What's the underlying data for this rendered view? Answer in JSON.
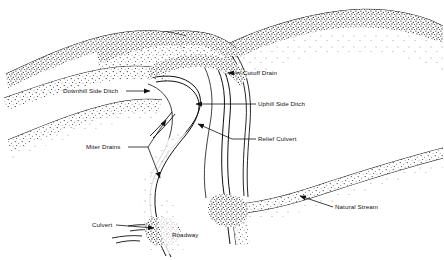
{
  "figure": {
    "kind": "line-drawing",
    "background_color": "#ffffff",
    "ink_color": "#111111"
  },
  "labels": [
    {
      "id": "cutoff-drain",
      "text": "Cutoff Drain",
      "x": 243,
      "y": 70,
      "arrow": "left"
    },
    {
      "id": "downhill-side-ditch",
      "text": "Downhill Side Ditch",
      "x": 63,
      "y": 88,
      "arrow": "right"
    },
    {
      "id": "uphill-side-ditch",
      "text": "Uphill Side Ditch",
      "x": 258,
      "y": 101,
      "arrow": "left"
    },
    {
      "id": "relief-culvert",
      "text": "Relief Culvert",
      "x": 258,
      "y": 136,
      "arrow": "left"
    },
    {
      "id": "miter-drains",
      "text": "Miter Drains",
      "x": 86,
      "y": 144,
      "arrow": "right"
    },
    {
      "id": "natural-stream",
      "text": "Natural Stream",
      "x": 335,
      "y": 204,
      "arrow": "left"
    },
    {
      "id": "culvert",
      "text": "Culvert",
      "x": 92,
      "y": 222,
      "arrow": "right"
    },
    {
      "id": "roadway",
      "text": "Roadway",
      "x": 172,
      "y": 232,
      "arrow": "none"
    }
  ],
  "features": {
    "ridges": 3,
    "road_switchback": true,
    "stream_direction": "lower-left to upper-right"
  }
}
